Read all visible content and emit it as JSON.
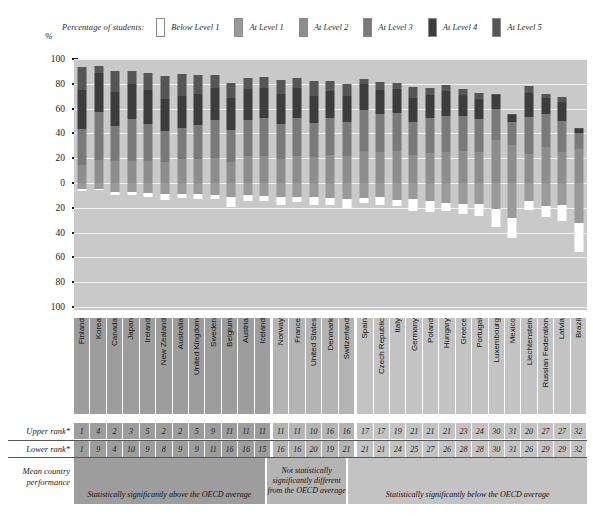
{
  "axis": {
    "unit_symbol": "%",
    "ticks": [
      100,
      80,
      60,
      40,
      20,
      0,
      20,
      40,
      60,
      80,
      100
    ]
  },
  "legend": {
    "title": "Percentage of students:",
    "items": [
      {
        "label": "Below Level 1",
        "color": "#ffffff"
      },
      {
        "label": "At Level 1",
        "color": "#9a9a9a"
      },
      {
        "label": "At Level 2",
        "color": "#8d8d8d"
      },
      {
        "label": "At Level 3",
        "color": "#7a7a7a"
      },
      {
        "label": "At Level 4",
        "color": "#3d3d3d"
      },
      {
        "label": "At Level 5",
        "color": "#565656"
      }
    ]
  },
  "rank_rows": {
    "upper_label": "Upper rank*",
    "lower_label": "Lower rank*",
    "mean_label": "Mean country\nperformance"
  },
  "bands": [
    {
      "key": "above",
      "text": "Statistically significantly above the OECD average",
      "count": 12
    },
    {
      "key": "not",
      "text": "Not statistically significantly different from the OECD average",
      "count": 5
    },
    {
      "key": "below",
      "text": "Statistically significantly below the OECD average",
      "count": 15
    }
  ],
  "chart_data": {
    "type": "bar",
    "xlabel": "",
    "ylabel": "%",
    "ylim": [
      -100,
      100
    ],
    "grid": true,
    "stacked": "diverging",
    "legend_position": "top",
    "note": "Segments above the zero line are Levels 2-5; segments below the zero line are Level 1 and Below Level 1.",
    "categories": [
      "Finland",
      "Korea",
      "Canada",
      "Japan",
      "Ireland",
      "New Zealand",
      "Australia",
      "United Kingdom",
      "Sweden",
      "Belgium",
      "Austria",
      "Iceland",
      "Norway",
      "France",
      "United States",
      "Denmark",
      "Switzerland",
      "Spain",
      "Czech Republic",
      "Italy",
      "Germany",
      "Poland",
      "Hungary",
      "Greece",
      "Portugal",
      "Luxembourg",
      "Mexico",
      "Liechtenstein",
      "Russian Federation",
      "Latvia",
      "Brazil"
    ],
    "series": [
      {
        "name": "Below Level 1",
        "values": [
          1.7,
          0.9,
          2.4,
          2.7,
          3.1,
          4.8,
          3.3,
          3.6,
          3.3,
          7.7,
          4.4,
          4.0,
          6.3,
          4.2,
          6.4,
          5.9,
          7.0,
          4.1,
          6.1,
          5.4,
          9.9,
          8.7,
          6.9,
          8.7,
          9.6,
          14.2,
          16.1,
          7.6,
          9.0,
          12.7,
          23.3
        ]
      },
      {
        "name": "At Level 1",
        "values": [
          5.2,
          4.8,
          7.2,
          7.3,
          8.0,
          8.9,
          9.1,
          9.2,
          9.3,
          11.3,
          10.0,
          10.5,
          11.2,
          11.0,
          11.5,
          12.0,
          13.3,
          12.1,
          11.4,
          13.5,
          12.7,
          14.6,
          15.8,
          16.7,
          16.7,
          21.0,
          28.1,
          14.5,
          18.5,
          17.9,
          32.5
        ]
      },
      {
        "name": "At Level 2",
        "values": [
          14.7,
          18.6,
          18.0,
          18.0,
          17.9,
          17.2,
          19.0,
          19.6,
          20.3,
          16.8,
          21.7,
          22.0,
          19.5,
          22.0,
          21.0,
          22.5,
          21.4,
          25.7,
          24.8,
          25.6,
          22.3,
          24.1,
          25.0,
          25.9,
          25.0,
          35.0,
          30.3,
          23.2,
          29.2,
          25.0,
          27.7
        ]
      },
      {
        "name": "At Level 3",
        "values": [
          28.7,
          38.8,
          28.0,
          33.3,
          29.7,
          24.6,
          25.5,
          27.5,
          30.4,
          25.8,
          29.4,
          30.8,
          28.3,
          30.6,
          27.4,
          29.5,
          28.0,
          32.8,
          30.9,
          30.6,
          26.8,
          28.2,
          28.8,
          28.1,
          26.3,
          25.0,
          18.8,
          30.1,
          26.4,
          25.1,
          12.9
        ]
      },
      {
        "name": "At Level 4",
        "values": [
          31.6,
          31.1,
          27.7,
          28.8,
          27.1,
          25.8,
          25.9,
          24.4,
          25.6,
          26.3,
          24.9,
          23.6,
          23.7,
          23.7,
          21.5,
          22.0,
          21.0,
          21.1,
          19.0,
          19.5,
          19.4,
          18.6,
          20.0,
          16.7,
          16.7,
          11.2,
          6.0,
          19.5,
          13.3,
          15.0,
          3.1
        ]
      },
      {
        "name": "At Level 5",
        "values": [
          18.5,
          5.7,
          16.8,
          9.9,
          14.2,
          18.7,
          17.6,
          15.6,
          11.2,
          12.0,
          8.8,
          9.1,
          11.2,
          8.5,
          12.2,
          8.1,
          9.2,
          4.2,
          7.0,
          5.3,
          8.8,
          5.9,
          5.1,
          5.0,
          4.2,
          0.7,
          0.9,
          5.1,
          3.2,
          4.3,
          0.6
        ]
      }
    ],
    "upper_rank": [
      1,
      4,
      2,
      3,
      5,
      2,
      2,
      5,
      9,
      11,
      11,
      11,
      11,
      11,
      10,
      16,
      16,
      17,
      17,
      19,
      21,
      21,
      21,
      23,
      24,
      30,
      31,
      20,
      27,
      27,
      32
    ],
    "lower_rank": [
      1,
      9,
      4,
      10,
      9,
      8,
      9,
      9,
      11,
      16,
      16,
      15,
      16,
      16,
      20,
      19,
      21,
      21,
      21,
      24,
      25,
      27,
      26,
      28,
      28,
      30,
      31,
      26,
      29,
      29,
      32
    ],
    "significance": [
      "above",
      "above",
      "above",
      "above",
      "above",
      "above",
      "above",
      "above",
      "above",
      "above",
      "above",
      "above",
      "not",
      "not",
      "not",
      "not",
      "not",
      "below",
      "below",
      "below",
      "below",
      "below",
      "below",
      "below",
      "below",
      "below",
      "below",
      "below",
      "below",
      "below",
      "below"
    ]
  }
}
